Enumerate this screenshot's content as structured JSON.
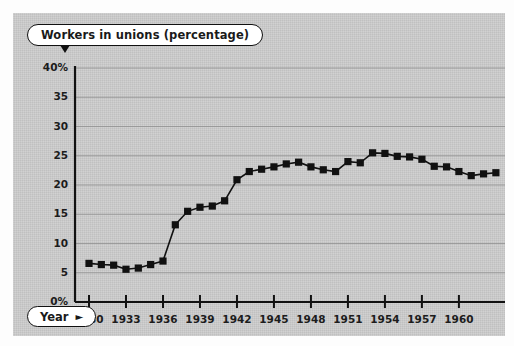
{
  "chart_data": {
    "type": "line",
    "title": "Workers in unions (percentage)",
    "xlabel": "Year",
    "ylabel": "Workers in unions (percentage)",
    "xlim": [
      1929.2,
      1963.5
    ],
    "ylim": [
      0,
      40
    ],
    "grid": true,
    "legend": null,
    "marker": "square",
    "line_color": "#111111",
    "marker_color": "#111111",
    "y_ticks": [
      0,
      5,
      10,
      15,
      20,
      25,
      30,
      35,
      40
    ],
    "y_tick_labels": [
      "0%",
      "5",
      "10",
      "15",
      "20",
      "25",
      "30",
      "35",
      "40%"
    ],
    "x_ticks": [
      1930,
      1933,
      1936,
      1939,
      1942,
      1945,
      1948,
      1951,
      1954,
      1957,
      1960
    ],
    "x_tick_labels": [
      "1930",
      "1933",
      "1936",
      "1939",
      "1942",
      "1945",
      "1948",
      "1951",
      "1954",
      "1957",
      "1960"
    ],
    "x": [
      1930,
      1931,
      1932,
      1933,
      1934,
      1935,
      1936,
      1937,
      1938,
      1939,
      1940,
      1941,
      1942,
      1943,
      1944,
      1945,
      1946,
      1947,
      1948,
      1949,
      1950,
      1951,
      1952,
      1953,
      1954,
      1955,
      1956,
      1957,
      1958,
      1959,
      1960,
      1961,
      1962,
      1963
    ],
    "values": [
      6.6,
      6.4,
      6.3,
      5.6,
      5.8,
      6.4,
      7.0,
      13.2,
      15.5,
      16.2,
      16.4,
      17.3,
      20.9,
      22.3,
      22.7,
      23.1,
      23.6,
      23.9,
      23.1,
      22.6,
      22.3,
      24.0,
      23.8,
      25.5,
      25.4,
      24.9,
      24.8,
      24.4,
      23.2,
      23.1,
      22.3,
      21.6,
      21.9,
      22.1
    ],
    "annotations": []
  },
  "title_pill": {
    "label": "Workers in unions (percentage)"
  },
  "year_pill": {
    "label": "Year",
    "arrow": "►"
  }
}
